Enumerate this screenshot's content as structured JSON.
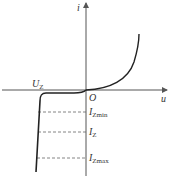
{
  "axes": {
    "x_label": "u",
    "y_label": "i",
    "origin_label": "O"
  },
  "labels": {
    "uz": {
      "main": "U",
      "sub": "Z"
    },
    "izmin": {
      "main": "I",
      "sub": "Zmin"
    },
    "iz": {
      "main": "I",
      "sub": "Z"
    },
    "izmax": {
      "main": "I",
      "sub": "Zmax"
    }
  },
  "colors": {
    "curve": "#222222",
    "axis": "#555555",
    "dashed": "#666666"
  }
}
